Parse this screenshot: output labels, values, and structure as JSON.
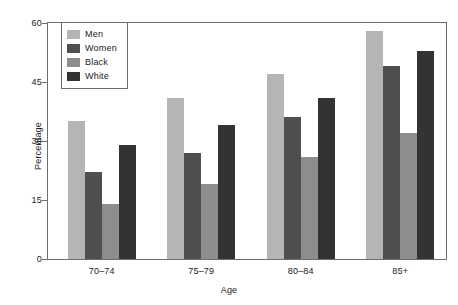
{
  "chart_data": {
    "type": "bar",
    "title": "",
    "subtitle": "",
    "xlabel": "Age",
    "ylabel": "Percentage",
    "categories": [
      "70–74",
      "75–79",
      "80–84",
      "85+"
    ],
    "series": [
      {
        "name": "Men",
        "color": "#b5b5b5",
        "values": [
          35,
          41,
          47,
          58
        ]
      },
      {
        "name": "Women",
        "color": "#4f4f4f",
        "values": [
          22,
          27,
          36,
          49
        ]
      },
      {
        "name": "Black",
        "color": "#8d8d8d",
        "values": [
          14,
          19,
          26,
          32
        ]
      },
      {
        "name": "White",
        "color": "#333333",
        "values": [
          29,
          34,
          41,
          53
        ]
      }
    ],
    "ylim": [
      0,
      60
    ],
    "yticks": [
      0,
      15,
      30,
      45,
      60
    ],
    "ytick_labels": [
      "0",
      "15",
      "30",
      "45",
      "60"
    ],
    "grid": false,
    "legend_position": "top-left",
    "axis_color": "#6e6e6e",
    "background": "#ffffff"
  }
}
